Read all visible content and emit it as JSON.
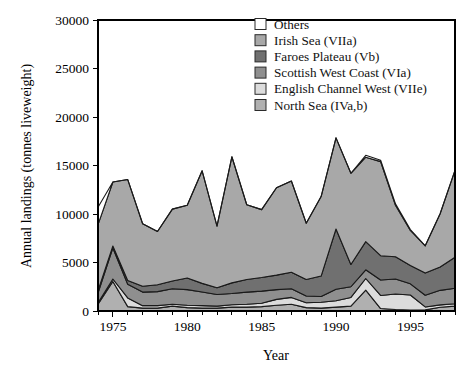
{
  "chart_data": {
    "type": "area",
    "stacked": true,
    "title": "",
    "xlabel": "Year",
    "ylabel": "Annual landings (tonnes liveweight)",
    "xlim": [
      1974,
      1998
    ],
    "ylim": [
      0,
      30000
    ],
    "xticks": [
      1975,
      1980,
      1985,
      1990,
      1995
    ],
    "xtick_labels": [
      "1975",
      "1980",
      "1985",
      "1990",
      "1995"
    ],
    "xticks_minor": [
      1974,
      1976,
      1977,
      1978,
      1979,
      1981,
      1982,
      1983,
      1984,
      1986,
      1987,
      1988,
      1989,
      1991,
      1992,
      1993,
      1994,
      1996,
      1997,
      1998
    ],
    "yticks": [
      0,
      5000,
      10000,
      15000,
      20000,
      25000,
      30000
    ],
    "ytick_labels": [
      "0",
      "5000",
      "10000",
      "15000",
      "20000",
      "25000",
      "30000"
    ],
    "grid": false,
    "legend_position": "top-right",
    "x": [
      1974,
      1975,
      1976,
      1977,
      1978,
      1979,
      1980,
      1981,
      1982,
      1983,
      1984,
      1985,
      1986,
      1987,
      1988,
      1989,
      1990,
      1991,
      1992,
      1993,
      1994,
      1995,
      1996,
      1997,
      1998
    ],
    "series": [
      {
        "name": "North Sea (IVa,b)",
        "color": "#b0b0b0",
        "values": [
          700,
          3050,
          450,
          300,
          300,
          500,
          350,
          300,
          300,
          400,
          400,
          450,
          600,
          700,
          350,
          300,
          400,
          500,
          2150,
          250,
          150,
          100,
          120,
          380,
          500
        ]
      },
      {
        "name": "English Channel West (VIIe)",
        "color": "#dcdcdc",
        "values": [
          150,
          250,
          900,
          250,
          250,
          200,
          250,
          250,
          200,
          250,
          300,
          350,
          600,
          700,
          500,
          600,
          650,
          900,
          1200,
          1350,
          1600,
          1550,
          300,
          250,
          250
        ]
      },
      {
        "name": "Scottish West Coast (VIa)",
        "color": "#8f8f8f",
        "values": [
          1000,
          3200,
          1400,
          1400,
          1450,
          1600,
          1600,
          1400,
          1200,
          1150,
          1250,
          1250,
          1000,
          900,
          700,
          600,
          1200,
          1100,
          900,
          1600,
          1550,
          1150,
          1200,
          1500,
          1600
        ]
      },
      {
        "name": "Faroes Plateau (Vb)",
        "color": "#707070",
        "values": [
          250,
          200,
          400,
          600,
          700,
          800,
          1200,
          900,
          700,
          1100,
          1300,
          1400,
          1500,
          1700,
          1700,
          2100,
          6200,
          2300,
          2900,
          2500,
          2300,
          1900,
          2300,
          2400,
          3200
        ]
      },
      {
        "name": "Irish Sea (VIIa)",
        "color": "#a8a8a8",
        "values": [
          6800,
          6600,
          10400,
          6450,
          5500,
          7400,
          7500,
          11600,
          6350,
          13000,
          7700,
          7000,
          9000,
          9400,
          5800,
          8200,
          9400,
          9400,
          8700,
          9700,
          5300,
          3600,
          2800,
          5500,
          8950
        ]
      },
      {
        "name": "Others",
        "color": "#ffffff",
        "values": [
          1800,
          0,
          0,
          0,
          0,
          0,
          0,
          0,
          0,
          0,
          0,
          0,
          0,
          0,
          0,
          0,
          0,
          0,
          200,
          150,
          150,
          100,
          0,
          0,
          0
        ]
      }
    ]
  },
  "legend": {
    "entries": [
      {
        "label": "Others",
        "color": "#ffffff"
      },
      {
        "label": "Irish Sea (VIIa)",
        "color": "#a8a8a8"
      },
      {
        "label": "Faroes Plateau (Vb)",
        "color": "#707070"
      },
      {
        "label": "Scottish West Coast (VIa)",
        "color": "#8f8f8f"
      },
      {
        "label": "English Channel West (VIIe)",
        "color": "#dcdcdc"
      },
      {
        "label": "North Sea (IVa,b)",
        "color": "#b0b0b0"
      }
    ]
  },
  "axes": {
    "x_title": "Year",
    "y_title": "Annual landings (tonnes liveweight)"
  }
}
